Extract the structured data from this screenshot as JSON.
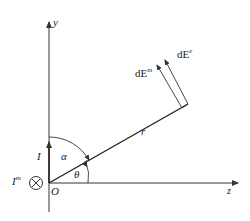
{
  "diagram": {
    "axes": {
      "y_label": "y",
      "z_label": "z",
      "origin_label": "O"
    },
    "labels": {
      "current": "I",
      "current_m_base": "I",
      "current_m_sup": "m",
      "radius": "r",
      "alpha": "α",
      "theta": "θ",
      "dE_m_base": "dE",
      "dE_m_sup": "m",
      "dE_e_base": "dE",
      "dE_e_sup": "e"
    },
    "symbols": {
      "into_page": "circle-cross-icon"
    },
    "colors": {
      "stroke": "#333333",
      "background": "#ffffff"
    }
  }
}
